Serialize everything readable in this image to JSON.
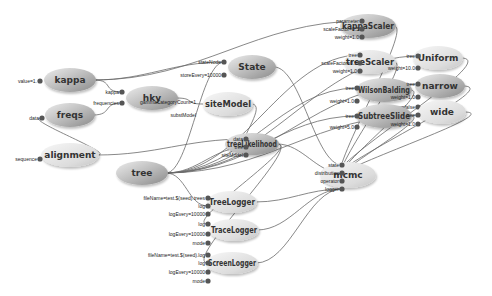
{
  "diagram": {
    "nodes": [
      {
        "id": "kappa",
        "label": "kappa",
        "shade": "dark",
        "ports": [
          {
            "label": "value=1.",
            "side": "left"
          }
        ]
      },
      {
        "id": "freqs",
        "label": "freqs",
        "shade": "dark",
        "ports": [
          {
            "label": "data",
            "side": "left"
          }
        ]
      },
      {
        "id": "alignment",
        "label": "alignment",
        "shade": "light",
        "ports": [
          {
            "label": "sequence",
            "side": "left"
          }
        ]
      },
      {
        "id": "hky",
        "label": "hky",
        "shade": "dark",
        "ports": [
          {
            "label": "kappa",
            "side": "left"
          },
          {
            "label": "frequencies",
            "side": "left"
          },
          {
            "label": "gammaCategoryCount=1",
            "side": "inside"
          },
          {
            "label": "substModel",
            "side": "inside"
          }
        ]
      },
      {
        "id": "State",
        "label": "State",
        "shade": "dark",
        "ports": [
          {
            "label": "stateNode",
            "side": "left"
          },
          {
            "label": "storeEvery=10000",
            "side": "left"
          }
        ]
      },
      {
        "id": "siteModel",
        "label": "siteModel",
        "shade": "light",
        "ports": []
      },
      {
        "id": "tree",
        "label": "tree",
        "shade": "dark",
        "ports": []
      },
      {
        "id": "treeLikelihood",
        "label": "treeLikelihood",
        "shade": "dark",
        "ports": [
          {
            "label": "data",
            "side": "left"
          },
          {
            "label": "tree",
            "side": "left"
          },
          {
            "label": "siteModel",
            "side": "left"
          }
        ]
      },
      {
        "id": "kappaScaler",
        "label": "kappaScaler",
        "shade": "dark",
        "ports": [
          {
            "label": "parameter",
            "side": "left"
          },
          {
            "label": "scaleFactor=0.5",
            "side": "left"
          },
          {
            "label": "weight=1.0",
            "side": "left"
          }
        ]
      },
      {
        "id": "treeScaler",
        "label": "treeScaler",
        "shade": "light",
        "ports": [
          {
            "label": "tree",
            "side": "left"
          },
          {
            "label": "scaleFactor=0.5",
            "side": "left"
          },
          {
            "label": "weight=1.0",
            "side": "left"
          }
        ]
      },
      {
        "id": "Uniform",
        "label": "Uniform",
        "shade": "light",
        "ports": [
          {
            "label": "tree",
            "side": "left"
          },
          {
            "label": "weight=10.0",
            "side": "left"
          }
        ]
      },
      {
        "id": "WilsonBalding",
        "label": "WilsonBalding",
        "shade": "dark",
        "ports": [
          {
            "label": "tree",
            "side": "left"
          },
          {
            "label": "weight=1.0",
            "side": "left"
          }
        ]
      },
      {
        "id": "narrow",
        "label": "narrow",
        "shade": "dark",
        "ports": [
          {
            "label": "tree",
            "side": "left"
          },
          {
            "label": "weight=1.0",
            "side": "left"
          },
          {
            "label": "isNarrow=false",
            "side": "left"
          }
        ]
      },
      {
        "id": "SubtreeSlide",
        "label": "SubtreeSlide",
        "shade": "dark",
        "ports": [
          {
            "label": "tree",
            "side": "left"
          },
          {
            "label": "weight=5.0",
            "side": "left"
          }
        ]
      },
      {
        "id": "wide",
        "label": "wide",
        "shade": "light",
        "ports": [
          {
            "label": "tree",
            "side": "left"
          },
          {
            "label": "weight=1.0",
            "side": "left"
          }
        ]
      },
      {
        "id": "mcmc",
        "label": "mcmc",
        "shade": "light",
        "ports": [
          {
            "label": "state",
            "side": "left"
          },
          {
            "label": "distribution",
            "side": "left"
          },
          {
            "label": "operator",
            "side": "left"
          },
          {
            "label": "logger",
            "side": "left"
          }
        ]
      },
      {
        "id": "TreeLogger",
        "label": "TreeLogger",
        "shade": "light",
        "ports": [
          {
            "label": "fileName=test.$(seed).trees",
            "side": "left"
          },
          {
            "label": "log",
            "side": "left"
          },
          {
            "label": "logEvery=10000",
            "side": "left"
          }
        ]
      },
      {
        "id": "TraceLogger",
        "label": "TraceLogger",
        "shade": "light",
        "ports": [
          {
            "label": "log",
            "side": "left"
          },
          {
            "label": "logEvery=10000",
            "side": "left"
          },
          {
            "label": "mode",
            "side": "left"
          }
        ]
      },
      {
        "id": "ScreenLogger",
        "label": "ScreenLogger",
        "shade": "light",
        "ports": [
          {
            "label": "fileName=test.$(seed).log",
            "side": "left"
          },
          {
            "label": "log",
            "side": "left"
          },
          {
            "label": "logEvery=10000",
            "side": "left"
          },
          {
            "label": "mode",
            "side": "left"
          }
        ]
      }
    ],
    "edges": [
      [
        "kappa",
        "hky.kappa"
      ],
      [
        "freqs",
        "hky.frequencies"
      ],
      [
        "alignment",
        "freqs.data"
      ],
      [
        "kappa",
        "kappaScaler.parameter"
      ],
      [
        "kappa",
        "State.stateNode"
      ],
      [
        "hky",
        "siteModel.substModel"
      ],
      [
        "siteModel",
        "treeLikelihood.siteModel"
      ],
      [
        "alignment",
        "treeLikelihood.data"
      ],
      [
        "tree",
        "treeLikelihood.tree"
      ],
      [
        "tree",
        "State.stateNode"
      ],
      [
        "tree",
        "treeScaler.tree"
      ],
      [
        "tree",
        "Uniform.tree"
      ],
      [
        "tree",
        "WilsonBalding.tree"
      ],
      [
        "tree",
        "narrow.tree"
      ],
      [
        "tree",
        "SubtreeSlide.tree"
      ],
      [
        "tree",
        "wide.tree"
      ],
      [
        "tree",
        "TreeLogger.log"
      ],
      [
        "State",
        "mcmc.state"
      ],
      [
        "treeLikelihood",
        "mcmc.distribution"
      ],
      [
        "kappaScaler",
        "mcmc.operator"
      ],
      [
        "treeScaler",
        "mcmc.operator"
      ],
      [
        "Uniform",
        "mcmc.operator"
      ],
      [
        "WilsonBalding",
        "mcmc.operator"
      ],
      [
        "narrow",
        "mcmc.operator"
      ],
      [
        "SubtreeSlide",
        "mcmc.operator"
      ],
      [
        "wide",
        "mcmc.operator"
      ],
      [
        "TreeLogger",
        "mcmc.logger"
      ],
      [
        "TraceLogger",
        "mcmc.logger"
      ],
      [
        "ScreenLogger",
        "mcmc.logger"
      ],
      [
        "treeLikelihood",
        "TraceLogger.log"
      ],
      [
        "treeLikelihood",
        "ScreenLogger.log"
      ]
    ]
  }
}
